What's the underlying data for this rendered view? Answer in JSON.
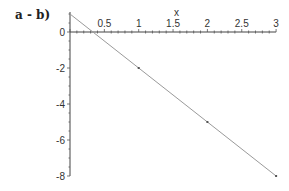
{
  "chart_data": {
    "type": "line",
    "title": "a - b)",
    "xlabel": "x",
    "ylabel": "",
    "x": [
      0,
      1,
      2,
      3
    ],
    "series": [
      {
        "name": "y = 1 - 3x",
        "values": [
          1,
          -2,
          -5,
          -8
        ],
        "color": "#9a9a9a"
      }
    ],
    "xlim": [
      0,
      3
    ],
    "ylim": [
      -8,
      1
    ],
    "x_ticks": [
      "0.5",
      "1",
      "1.5",
      "2",
      "2.5",
      "3"
    ],
    "y_ticks": [
      "0",
      "-2",
      "-4",
      "-6",
      "-8"
    ],
    "grid": false,
    "legend": "none"
  }
}
